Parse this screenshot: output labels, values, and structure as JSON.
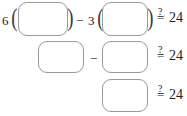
{
  "worksheet": {
    "type": "math-expression-worksheet",
    "box_border_color": "#9a9a9a",
    "text_color": "#222222",
    "background_color": "#ffffff",
    "rows": [
      {
        "id": "row-1",
        "leading_coefficient": "6",
        "open_paren_1": "(",
        "close_paren_1": ")",
        "operator": "−",
        "second_coefficient": "3",
        "open_paren_2": "(",
        "close_paren_2": ")",
        "box_1_value": "",
        "box_2_value": "",
        "relation_question": "?",
        "relation_equals": "=",
        "right_hand_side": "24"
      },
      {
        "id": "row-2",
        "operator": "−",
        "box_1_value": "",
        "box_2_value": "",
        "relation_question": "?",
        "relation_equals": "=",
        "right_hand_side": "24"
      },
      {
        "id": "row-3",
        "box_1_value": "",
        "relation_question": "?",
        "relation_equals": "=",
        "right_hand_side": "24"
      }
    ]
  }
}
